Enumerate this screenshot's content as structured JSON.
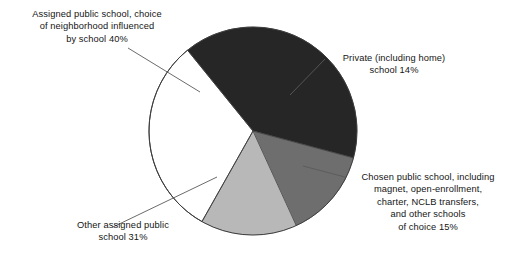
{
  "figure": {
    "background_color": "#ffffff",
    "width": 525,
    "height": 256
  },
  "pie": {
    "center_x": 253,
    "center_y": 131,
    "radius": 104,
    "rim_color": "#000000",
    "outline_color": "#4a4a4a"
  },
  "labels": {
    "assigned_choice": "Assigned public school, choice\nof neighborhood influenced\nby school 40%",
    "private": "Private (including home)\nschool 14%",
    "chosen": "Chosen public school, including\nmagnet, open-enrollment,\ncharter, NCLB transfers,\nand other schools\nof choice 15%",
    "other_assigned": "Other assigned public\nschool 31%"
  },
  "chart_data": {
    "type": "pie",
    "title": "",
    "xlabel": "",
    "ylabel": "",
    "legend_position": "none",
    "grid": false,
    "units": "percent",
    "total": 100,
    "start_angle_deg": -39,
    "direction": "clockwise",
    "categories": [
      "Assigned public school, choice of neighborhood influenced by school",
      "Private (including home) school",
      "Chosen public school, including magnet, open-enrollment, charter, NCLB transfers, and other schools of choice",
      "Other assigned public school"
    ],
    "values": [
      40,
      14,
      15,
      31
    ],
    "labels": [
      "Assigned public school, choice of neighborhood influenced by school 40%",
      "Private (including home) school 14%",
      "Chosen public school, including magnet, open-enrollment, charter, NCLB transfers, and other schools of choice 15%",
      "Other assigned public school 31%"
    ],
    "colors": [
      "#262626",
      "#6e6e6e",
      "#b8b8b8",
      "#ffffff"
    ],
    "slices": [
      {
        "name": "assigned-choice",
        "label": "Assigned public school, choice of neighborhood influenced by school",
        "value": 40,
        "color": "#262626",
        "start_deg": -39,
        "end_deg": 105
      },
      {
        "name": "private",
        "label": "Private (including home) school",
        "value": 14,
        "color": "#6e6e6e",
        "start_deg": 105,
        "end_deg": 155.4
      },
      {
        "name": "chosen",
        "label": "Chosen public school, including magnet, open-enrollment, charter, NCLB transfers, and other schools of choice",
        "value": 15,
        "color": "#b8b8b8",
        "start_deg": 155.4,
        "end_deg": 209.4
      },
      {
        "name": "other-assigned",
        "label": "Other assigned public school",
        "value": 31,
        "color": "#ffffff",
        "start_deg": 209.4,
        "end_deg": 321
      }
    ]
  }
}
